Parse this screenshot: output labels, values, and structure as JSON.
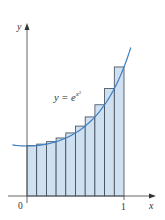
{
  "chart_data": {
    "type": "bar",
    "title": "",
    "function_label": "y = e^{x^2}",
    "function_label_parts": {
      "lhs": "y",
      "eq": "=",
      "base": "e",
      "exponent": "x",
      "exponent_power": "2"
    },
    "xlabel": "x",
    "ylabel": "y",
    "x_ticks": [
      "0",
      "1"
    ],
    "xlim": [
      0,
      1
    ],
    "n_rectangles": 10,
    "rule": "right endpoints (upper sum)",
    "categories": [
      "0.0-0.1",
      "0.1-0.2",
      "0.2-0.3",
      "0.3-0.4",
      "0.4-0.5",
      "0.5-0.6",
      "0.6-0.7",
      "0.7-0.8",
      "0.8-0.9",
      "0.9-1.0"
    ],
    "x_right": [
      0.1,
      0.2,
      0.3,
      0.4,
      0.5,
      0.6,
      0.7,
      0.8,
      0.9,
      1.0
    ],
    "values": [
      1.01,
      1.041,
      1.094,
      1.174,
      1.284,
      1.433,
      1.632,
      1.896,
      2.248,
      2.718
    ],
    "curve": {
      "function": "exp(x^2)",
      "x_start": -0.15,
      "x_end": 1.07
    },
    "grid": false,
    "legend": "none",
    "colors": {
      "bar_fill": "#cfe1f1",
      "bar_edge": "#3c4654",
      "curve": "#3f7fc4",
      "axis": "#555555"
    }
  },
  "labels": {
    "y_axis": "y",
    "x_axis": "x",
    "origin": "0",
    "one": "1",
    "func_lhs": "y = e",
    "func_exp": "x",
    "func_exp_pow": "2"
  }
}
